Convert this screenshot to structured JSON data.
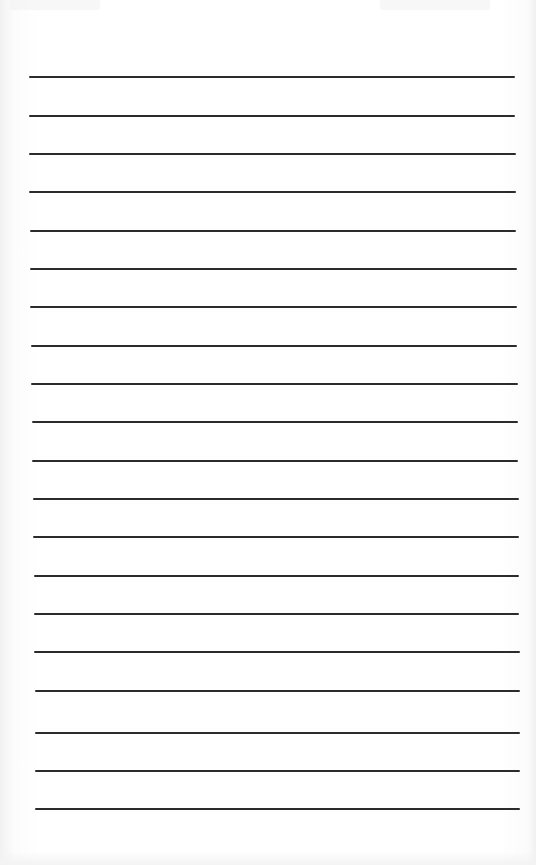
{
  "page": {
    "type": "lined-paper",
    "background_color": "#ffffff",
    "rule_color": "#2b2b2b",
    "rule_count": 20,
    "rules": [
      {
        "y": 76,
        "x1": 29,
        "x2": 515
      },
      {
        "y": 115,
        "x1": 29,
        "x2": 515
      },
      {
        "y": 153,
        "x1": 29,
        "x2": 516
      },
      {
        "y": 191,
        "x1": 29,
        "x2": 516
      },
      {
        "y": 230,
        "x1": 30,
        "x2": 516
      },
      {
        "y": 268,
        "x1": 30,
        "x2": 517
      },
      {
        "y": 306,
        "x1": 30,
        "x2": 517
      },
      {
        "y": 345,
        "x1": 31,
        "x2": 517
      },
      {
        "y": 383,
        "x1": 31,
        "x2": 518
      },
      {
        "y": 421,
        "x1": 32,
        "x2": 518
      },
      {
        "y": 460,
        "x1": 32,
        "x2": 518
      },
      {
        "y": 498,
        "x1": 33,
        "x2": 519
      },
      {
        "y": 536,
        "x1": 33,
        "x2": 519
      },
      {
        "y": 575,
        "x1": 34,
        "x2": 519
      },
      {
        "y": 613,
        "x1": 34,
        "x2": 519
      },
      {
        "y": 651,
        "x1": 34,
        "x2": 520
      },
      {
        "y": 690,
        "x1": 35,
        "x2": 520
      },
      {
        "y": 732,
        "x1": 35,
        "x2": 520
      },
      {
        "y": 770,
        "x1": 35,
        "x2": 520
      },
      {
        "y": 808,
        "x1": 35,
        "x2": 520
      }
    ]
  }
}
